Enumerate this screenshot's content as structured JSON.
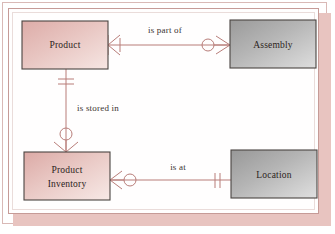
{
  "diagram": {
    "type": "entity-relationship-diagram",
    "notation": "crow's-foot",
    "title": "",
    "entities": [
      {
        "id": "product",
        "label": "Product",
        "fill": "#e6c0bd",
        "x": 22,
        "y": 21,
        "width": 86,
        "height": 48
      },
      {
        "id": "assembly",
        "label": "Assembly",
        "fill": "#b3b3b3",
        "x": 230,
        "y": 20,
        "width": 86,
        "height": 48
      },
      {
        "id": "product-inventory",
        "label_line1": "Product",
        "label_line2": "Inventory",
        "label": "Product Inventory",
        "fill": "#e6c0bd",
        "x": 24,
        "y": 152,
        "width": 86,
        "height": 48
      },
      {
        "id": "location",
        "label": "Location",
        "fill": "#b3b3b3",
        "x": 231,
        "y": 150,
        "width": 86,
        "height": 48
      }
    ],
    "relationships": [
      {
        "id": "is-part-of",
        "label": "is part of",
        "from": "product",
        "to": "assembly",
        "from_cardinality": "one-or-many",
        "to_cardinality": "zero-or-many",
        "label_x": 165,
        "label_y": 35
      },
      {
        "id": "is-stored-in",
        "label": "is stored in",
        "from": "product",
        "to": "product-inventory",
        "from_cardinality": "exactly-one",
        "to_cardinality": "zero-or-many",
        "label_x": 97,
        "label_y": 108
      },
      {
        "id": "is-at",
        "label": "is at",
        "from": "product-inventory",
        "to": "location",
        "from_cardinality": "zero-or-many",
        "to_cardinality": "exactly-one",
        "label_x": 178,
        "label_y": 170
      }
    ],
    "colors": {
      "connector": "#b87d79",
      "entity_border": "#4a4441",
      "entity_pink": "#e6c0bd",
      "entity_gray": "#b3b3b3",
      "frame_border": "#c69b97",
      "frame_shadow": "#e8c4c0",
      "page_background": "#ffffff",
      "text": "#2b2320"
    }
  }
}
